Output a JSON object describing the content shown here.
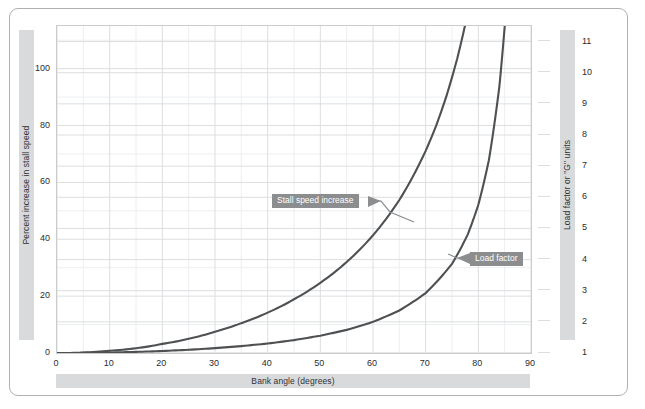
{
  "chart_data": {
    "type": "line",
    "title": "",
    "xlabel": "Bank angle (degrees)",
    "ylabel": "Percent increase in stall speed",
    "y2label": "Load factor or \"G\" units",
    "xlim": [
      0,
      90
    ],
    "ylim": [
      0,
      115
    ],
    "y2lim": [
      1,
      11.5
    ],
    "xticks": [
      "0",
      "10",
      "20",
      "30",
      "40",
      "50",
      "60",
      "70",
      "80",
      "90"
    ],
    "xtick_values": [
      0,
      10,
      20,
      30,
      40,
      50,
      60,
      70,
      80,
      90
    ],
    "yticks": [
      "0",
      "20",
      "40",
      "60",
      "80",
      "100"
    ],
    "ytick_values": [
      0,
      20,
      40,
      60,
      80,
      100
    ],
    "y2ticks": [
      "1",
      "2",
      "3",
      "4",
      "5",
      "6",
      "7",
      "8",
      "9",
      "10",
      "11"
    ],
    "y2tick_values": [
      1,
      2,
      3,
      4,
      5,
      6,
      7,
      8,
      9,
      10,
      11
    ],
    "grid": true,
    "minor_grid": true,
    "legend_position": "inline-callouts",
    "line_color": "#4e5052",
    "series": [
      {
        "name": "Stall speed increase",
        "axis": "left",
        "x": [
          0,
          5,
          10,
          15,
          20,
          25,
          30,
          35,
          40,
          45,
          50,
          55,
          60,
          65,
          70,
          72,
          74,
          76,
          78,
          79,
          80
        ],
        "values": [
          0,
          0.2,
          0.8,
          1.7,
          3.2,
          5.0,
          7.5,
          10.5,
          14.2,
          18.9,
          24.7,
          32.0,
          41.4,
          53.8,
          71.1,
          80.0,
          90.7,
          103.6,
          119.6,
          129.2,
          140.1
        ]
      },
      {
        "name": "Load factor",
        "axis": "right",
        "x": [
          0,
          5,
          10,
          15,
          20,
          25,
          30,
          35,
          40,
          45,
          50,
          55,
          60,
          65,
          70,
          75,
          78,
          80,
          82,
          84,
          85,
          86
        ],
        "values": [
          1.0,
          1.004,
          1.015,
          1.035,
          1.064,
          1.103,
          1.155,
          1.221,
          1.305,
          1.414,
          1.556,
          1.743,
          2.0,
          2.366,
          2.924,
          3.864,
          4.81,
          5.76,
          7.19,
          9.57,
          11.47,
          14.34
        ]
      }
    ],
    "annotations": [
      {
        "text": "Stall speed increase",
        "points_to": "stall-speed-curve"
      },
      {
        "text": "Load factor",
        "points_to": "load-factor-curve"
      }
    ]
  },
  "axes": {
    "left": {
      "title": "Percent increase in stall speed",
      "ticks": [
        "0",
        "20",
        "40",
        "60",
        "80",
        "100"
      ]
    },
    "right": {
      "title": "Load factor or \"G\" units",
      "ticks": [
        "1",
        "2",
        "3",
        "4",
        "5",
        "6",
        "7",
        "8",
        "9",
        "10",
        "11"
      ]
    },
    "bottom": {
      "title": "Bank angle (degrees)",
      "ticks": [
        "0",
        "10",
        "20",
        "30",
        "40",
        "50",
        "60",
        "70",
        "80",
        "90"
      ]
    }
  },
  "callouts": {
    "stall": "Stall speed increase",
    "load": "Load factor"
  },
  "colors": {
    "curve": "#4e5052",
    "band": "#d9dadb",
    "callout_bg": "#8b8d8f",
    "grid_major": "#dcdee0",
    "grid_minor": "#eceef0",
    "frame": "#aeb0b2"
  }
}
